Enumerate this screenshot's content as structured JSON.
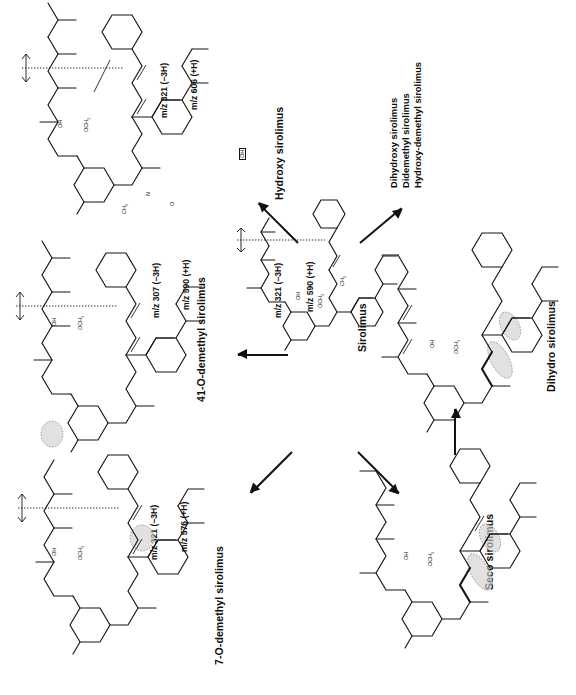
{
  "figure": {
    "type": "metabolic-pathway-diagram",
    "orientation": "page rotated 90 degrees counter-clockwise; all text reads bottom-to-top",
    "background_color": "#ffffff",
    "line_color": "#141414",
    "highlight_color": "#cfcfcf"
  },
  "parent": {
    "id": "sirolimus",
    "name": "Sirolimus",
    "mz_fragment": "m/z 321 (−3H)",
    "mz_precursor": "m/z 590 (+H)"
  },
  "metabolites": [
    {
      "id": "hydroxy-sirolimus",
      "name": "Hydroxy sirolimus",
      "mz_fragment": "m/z 321 (−3H)",
      "mz_precursor": "m/z 606 (+H)",
      "site_label": "OH",
      "site_marker": "boxed",
      "direction": "upper-left"
    },
    {
      "id": "41-o-demethyl-sirolimus",
      "name": "41-O-demethyl sirolimus",
      "mz_fragment": "m/z 307 (−3H)",
      "mz_precursor": "m/z 590 (+H)",
      "site_label": "OH",
      "site_marker": "shaded-circle",
      "direction": "left"
    },
    {
      "id": "7-o-demethyl-sirolimus",
      "name": "7-O-demethyl sirolimus",
      "mz_fragment": "m/z 321 (−3H)",
      "mz_precursor": "m/z 576 (+H)",
      "site_label": "OH",
      "site_marker": "shaded-circle",
      "direction": "lower-left"
    },
    {
      "id": "seco-sirolimus",
      "name": "Seco sirolimus",
      "mz_fragment": "",
      "mz_precursor": "",
      "site_label": "OH",
      "site_marker": "shaded-ellipse",
      "direction": "lower-right"
    },
    {
      "id": "dihydro-sirolimus",
      "name": "Dihydro sirolimus",
      "mz_fragment": "",
      "mz_precursor": "",
      "site_label": "",
      "site_marker": "shaded-ellipse",
      "direction": "right"
    }
  ],
  "other_metabolites": {
    "heading": "",
    "items": [
      "Dihydroxy sirolimus",
      "Didemethyl sirolimus",
      "Hydroxy-demethyl sirolimus"
    ]
  },
  "atom_labels": {
    "oh": "OH",
    "och3": "OCH",
    "ch3": "CH",
    "o": "O",
    "n": "N",
    "sub3": "3"
  },
  "arrows": [
    {
      "id": "arrow-to-hydroxy",
      "from": "sirolimus",
      "to": "hydroxy-sirolimus"
    },
    {
      "id": "arrow-to-41-o-demethyl",
      "from": "sirolimus",
      "to": "41-o-demethyl-sirolimus"
    },
    {
      "id": "arrow-to-7-o-demethyl",
      "from": "sirolimus",
      "to": "7-o-demethyl-sirolimus"
    },
    {
      "id": "arrow-to-seco",
      "from": "sirolimus",
      "to": "seco-sirolimus"
    },
    {
      "id": "arrow-to-dihydro",
      "from": "seco-sirolimus",
      "to": "dihydro-sirolimus"
    },
    {
      "id": "arrow-to-other",
      "from": "sirolimus",
      "to": "other-metabolites-list"
    }
  ]
}
